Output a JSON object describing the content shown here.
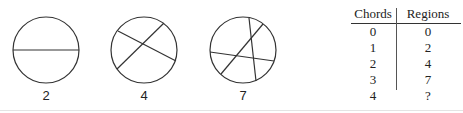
{
  "figure": {
    "circles": [
      {
        "chords": 1,
        "label": "2"
      },
      {
        "chords": 2,
        "label": "4"
      },
      {
        "chords": 3,
        "label": "7"
      }
    ],
    "table": {
      "headers": [
        "Chords",
        "Regions"
      ],
      "rows": [
        [
          "0",
          "0"
        ],
        [
          "1",
          "2"
        ],
        [
          "2",
          "4"
        ],
        [
          "3",
          "7"
        ],
        [
          "4",
          "?"
        ]
      ]
    }
  }
}
